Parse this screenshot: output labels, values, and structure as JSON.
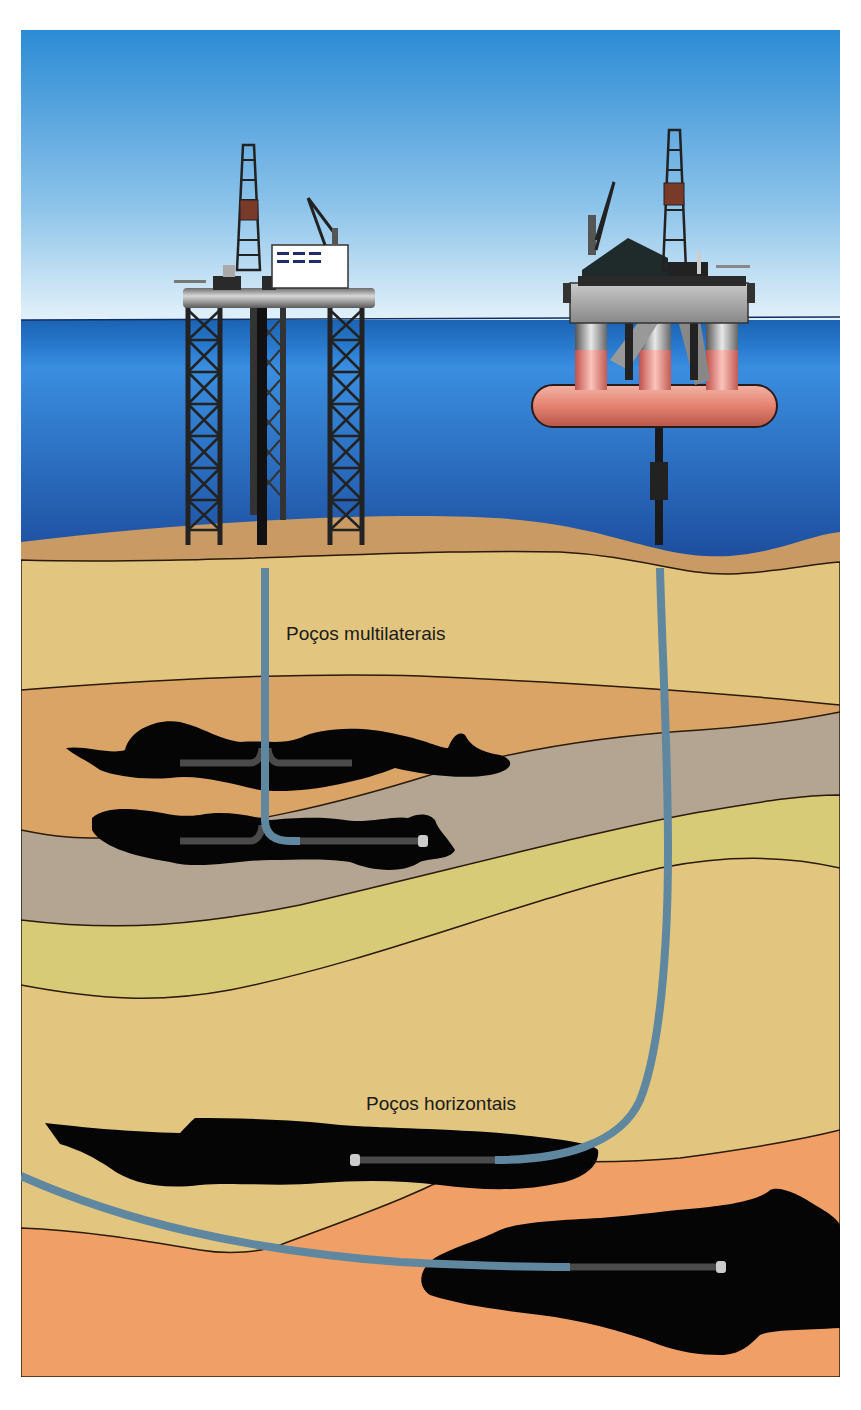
{
  "labels": {
    "multilateral": "Poços multilaterais",
    "horizontal": "Poços horizontais"
  },
  "colors": {
    "sky_top": "#2e8fd6",
    "sky_bottom": "#d8ecf7",
    "sea_top": "#1a5fae",
    "sea_mid": "#2f7fd0",
    "sea_bottom": "#1d4fa0",
    "seabed": "#c99a63",
    "layer_sand": "#e2c67f",
    "layer_tan": "#d9a466",
    "layer_gray": "#b3a591",
    "layer_olive": "#d8cb78",
    "layer_orange": "#f0a066",
    "oil": "#050505",
    "pipe": "#5f88a0",
    "liner": "#4a4a4a",
    "platform_steel": "#222222",
    "pontoon": "#e58a78"
  },
  "structures": [
    {
      "name": "jack-up-platform",
      "type": "fixed platform"
    },
    {
      "name": "semi-submersible-platform",
      "type": "floating platform"
    }
  ]
}
